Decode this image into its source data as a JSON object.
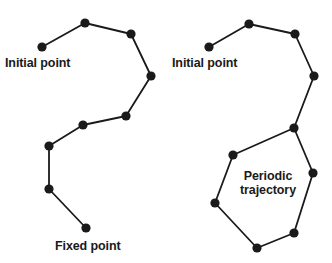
{
  "figure": {
    "background_color": "#ffffff",
    "stroke_color": "#1a1a1a",
    "node_color": "#1a1a1a",
    "node_radius": 4.6,
    "line_width": 1.8,
    "panels": [
      {
        "name": "left-panel",
        "description": "Open trajectory from initial point to fixed point",
        "labels": [
          {
            "name": "initial-point-label-left",
            "lines": [
              "Initial point"
            ],
            "x": 5,
            "y": 56,
            "align": "left"
          },
          {
            "name": "fixed-point-label",
            "lines": [
              "Fixed point"
            ],
            "x": 55,
            "y": 239,
            "align": "left"
          }
        ],
        "nodes": [
          {
            "name": "node-initial",
            "x": 42,
            "y": 47
          },
          {
            "name": "node-2",
            "x": 85,
            "y": 23
          },
          {
            "name": "node-3",
            "x": 131,
            "y": 34
          },
          {
            "name": "node-4",
            "x": 151,
            "y": 76
          },
          {
            "name": "node-5",
            "x": 126,
            "y": 116
          },
          {
            "name": "node-6",
            "x": 83,
            "y": 125
          },
          {
            "name": "node-7",
            "x": 49,
            "y": 146
          },
          {
            "name": "node-8",
            "x": 49,
            "y": 189
          },
          {
            "name": "node-fixed",
            "x": 86,
            "y": 228
          }
        ],
        "edges": [
          [
            "node-initial",
            "node-2"
          ],
          [
            "node-2",
            "node-3"
          ],
          [
            "node-3",
            "node-4"
          ],
          [
            "node-4",
            "node-5"
          ],
          [
            "node-5",
            "node-6"
          ],
          [
            "node-6",
            "node-7"
          ],
          [
            "node-7",
            "node-8"
          ],
          [
            "node-8",
            "node-fixed"
          ]
        ]
      },
      {
        "name": "right-panel",
        "description": "Trajectory from initial point into a closed periodic orbit",
        "labels": [
          {
            "name": "initial-point-label-right",
            "lines": [
              "Initial point"
            ],
            "x": 172,
            "y": 56,
            "align": "left"
          },
          {
            "name": "periodic-trajectory-label",
            "lines": [
              "Periodic",
              "trajectory"
            ],
            "x": 268,
            "y": 169,
            "align": "center"
          }
        ],
        "nodes": [
          {
            "name": "node-initial",
            "x": 209,
            "y": 47
          },
          {
            "name": "node-2",
            "x": 249,
            "y": 24
          },
          {
            "name": "node-3",
            "x": 295,
            "y": 34
          },
          {
            "name": "node-4",
            "x": 314,
            "y": 76
          },
          {
            "name": "node-junction",
            "x": 294,
            "y": 128
          },
          {
            "name": "node-loop-upper-left",
            "x": 233,
            "y": 155
          },
          {
            "name": "node-loop-left",
            "x": 215,
            "y": 203
          },
          {
            "name": "node-loop-bottom",
            "x": 257,
            "y": 248
          },
          {
            "name": "node-loop-lower-right",
            "x": 294,
            "y": 233
          },
          {
            "name": "node-loop-right",
            "x": 313,
            "y": 173
          }
        ],
        "edges": [
          [
            "node-initial",
            "node-2"
          ],
          [
            "node-2",
            "node-3"
          ],
          [
            "node-3",
            "node-4"
          ],
          [
            "node-4",
            "node-junction"
          ],
          [
            "node-junction",
            "node-loop-upper-left"
          ],
          [
            "node-loop-upper-left",
            "node-loop-left"
          ],
          [
            "node-loop-left",
            "node-loop-bottom"
          ],
          [
            "node-loop-bottom",
            "node-loop-lower-right"
          ],
          [
            "node-loop-lower-right",
            "node-loop-right"
          ],
          [
            "node-loop-right",
            "node-junction"
          ]
        ]
      }
    ]
  }
}
